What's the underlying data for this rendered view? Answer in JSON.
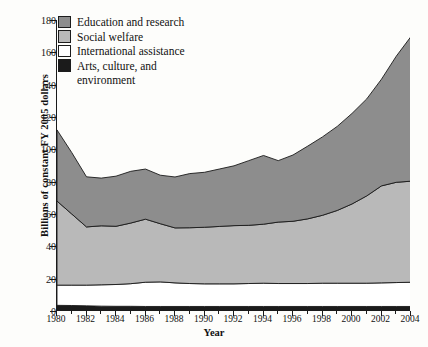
{
  "chart_data": {
    "type": "area",
    "stacked": true,
    "title": "",
    "xlabel": "Year",
    "ylabel": "Billions of constant FY 2005 dollars",
    "xlim": [
      1980,
      2004
    ],
    "ylim": [
      0,
      180
    ],
    "yticks": [
      0,
      20,
      40,
      60,
      80,
      100,
      120,
      140,
      160,
      180
    ],
    "xticks": [
      1980,
      1982,
      1984,
      1986,
      1988,
      1990,
      1992,
      1994,
      1996,
      1998,
      2000,
      2002,
      2004
    ],
    "xticklabels": [
      "1980",
      "1982",
      "1984",
      "1986",
      "1988",
      "1990",
      "1992",
      "1994",
      "1996",
      "1998",
      "2000",
      "2002",
      "2004"
    ],
    "yticklabels": [
      "0",
      "20",
      "40",
      "60",
      "80",
      "100",
      "120",
      "140",
      "160",
      "180"
    ],
    "grid": false,
    "legend_position": "upper left",
    "x": [
      1980,
      1981,
      1982,
      1983,
      1984,
      1985,
      1986,
      1987,
      1988,
      1989,
      1990,
      1991,
      1992,
      1993,
      1994,
      1995,
      1996,
      1997,
      1998,
      1999,
      2000,
      2001,
      2002,
      2003,
      2004
    ],
    "series": [
      {
        "name": "Arts, culture, and environment",
        "color": "#1b1b1b",
        "values": [
          3.5,
          3.4,
          3.2,
          3.0,
          2.9,
          2.9,
          2.8,
          2.8,
          2.8,
          2.8,
          2.8,
          2.8,
          2.8,
          2.8,
          2.8,
          2.8,
          2.8,
          2.8,
          2.8,
          2.8,
          2.8,
          2.8,
          2.8,
          2.8,
          2.8
        ]
      },
      {
        "name": "International assistance",
        "color": "#ffffff",
        "values": [
          12.5,
          12.6,
          12.8,
          13.2,
          13.5,
          14.0,
          15.0,
          15.2,
          14.6,
          14.2,
          14.0,
          14.0,
          14.0,
          14.2,
          14.4,
          14.2,
          14.2,
          14.2,
          14.4,
          14.4,
          14.4,
          14.4,
          14.6,
          14.8,
          15.0
        ]
      },
      {
        "name": "Social welfare",
        "color": "#b9b9b9",
        "values": [
          52.0,
          44.0,
          36.0,
          36.5,
          36.0,
          37.5,
          39.0,
          36.0,
          34.0,
          34.5,
          35.0,
          35.5,
          36.0,
          36.0,
          36.5,
          38.0,
          38.5,
          40.0,
          42.0,
          45.0,
          49.0,
          54.0,
          60.0,
          62.0,
          62.5
        ]
      },
      {
        "name": "Education and research",
        "color": "#8d8d8d",
        "values": [
          44.0,
          38.0,
          31.0,
          29.5,
          31.0,
          32.0,
          31.0,
          30.0,
          31.5,
          33.5,
          34.0,
          35.5,
          37.0,
          40.0,
          42.5,
          38.0,
          41.0,
          45.0,
          48.5,
          52.0,
          56.0,
          60.0,
          66.0,
          78.0,
          89.5
        ]
      }
    ],
    "totals": [
      112.0,
      98.0,
      83.0,
      82.2,
      83.4,
      86.4,
      87.8,
      84.0,
      82.9,
      85.0,
      85.8,
      87.8,
      89.8,
      93.0,
      96.2,
      93.0,
      96.5,
      102.0,
      107.7,
      114.2,
      122.2,
      131.2,
      143.4,
      157.6,
      169.8
    ]
  },
  "legend": {
    "items": [
      {
        "label": "Education and research",
        "swatch": "#8d8d8d"
      },
      {
        "label": "Social welfare",
        "swatch": "#b9b9b9"
      },
      {
        "label": "International assistance",
        "swatch": "#ffffff"
      },
      {
        "label": "Arts, culture, and",
        "label_cont": "environment",
        "swatch": "#1b1b1b"
      }
    ]
  },
  "axes": {
    "ylabel": "Billions of constant FY 2005 dollars",
    "xlabel": "Year"
  }
}
